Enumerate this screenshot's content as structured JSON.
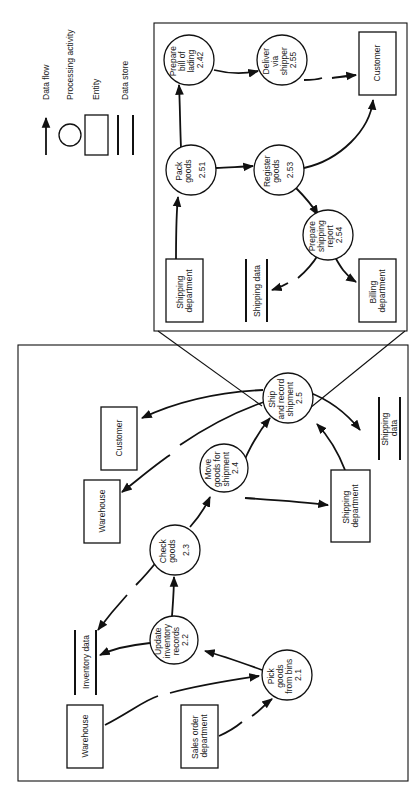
{
  "legend": {
    "data_flow": "Data flow",
    "processing_activity": "Processing activity",
    "entity": "Entity",
    "data_store": "Data store"
  },
  "detail": {
    "processes": {
      "prepare_bill": [
        "Prepare",
        "bill of",
        "lading",
        "2.42"
      ],
      "deliver": [
        "Deliver",
        "via",
        "shipper",
        "2.55"
      ],
      "pack": [
        "Pack",
        "goods",
        "2.51"
      ],
      "register": [
        "Register",
        "goods",
        "2.53"
      ],
      "prepare_report": [
        "Prepare",
        "shipping",
        "report",
        "2.54"
      ]
    },
    "entities": {
      "customer": "Customer",
      "shipping_dept": [
        "Shipping",
        "department"
      ],
      "billing_dept": [
        "Billing",
        "department"
      ]
    },
    "stores": {
      "shipping_data": "Shipping data"
    }
  },
  "overview": {
    "processes": {
      "ship_record": [
        "Ship",
        "and record",
        "shipment",
        "2.5"
      ],
      "move_goods": [
        "Move",
        "goods for",
        "shipment",
        "2.4"
      ],
      "check_goods": [
        "Check",
        "goods",
        "2.3"
      ],
      "update_inventory": [
        "Update",
        "inventory",
        "records",
        "2.2"
      ],
      "pick_goods": [
        "Pick",
        "goods",
        "from bins",
        "2.1"
      ]
    },
    "entities": {
      "customer": "Customer",
      "warehouse_top": "Warehouse",
      "warehouse_bottom": "Warehouse",
      "shipping_dept": [
        "Shipping",
        "department"
      ],
      "sales_dept": [
        "Sales order",
        "department"
      ]
    },
    "stores": {
      "shipping_data": [
        "Shipping",
        "data"
      ],
      "inventory_data": "Inventory data"
    }
  }
}
